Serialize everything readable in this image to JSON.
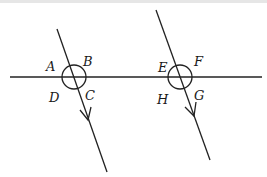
{
  "diagram": {
    "colors": {
      "stroke": "#222222",
      "background": "#ffffff"
    },
    "horizontal_line": {
      "x1": 10,
      "y1": 77,
      "x2": 262,
      "y2": 77
    },
    "transversals": [
      {
        "id": "left",
        "x1": 57,
        "y1": 29,
        "x2": 107,
        "y2": 172,
        "arrow": {
          "x": 88,
          "y": 118
        }
      },
      {
        "id": "right",
        "x1": 156,
        "y1": 10,
        "x2": 210,
        "y2": 160,
        "arrow": {
          "x": 194,
          "y": 113
        }
      }
    ],
    "intersections": [
      {
        "cx": 74,
        "cy": 77,
        "r": 12,
        "labels": [
          "A",
          "B",
          "C",
          "D"
        ]
      },
      {
        "cx": 180,
        "cy": 77,
        "r": 12,
        "labels": [
          "E",
          "F",
          "G",
          "H"
        ]
      }
    ],
    "labels": {
      "A": "A",
      "B": "B",
      "C": "C",
      "D": "D",
      "E": "E",
      "F": "F",
      "G": "G",
      "H": "H"
    }
  }
}
